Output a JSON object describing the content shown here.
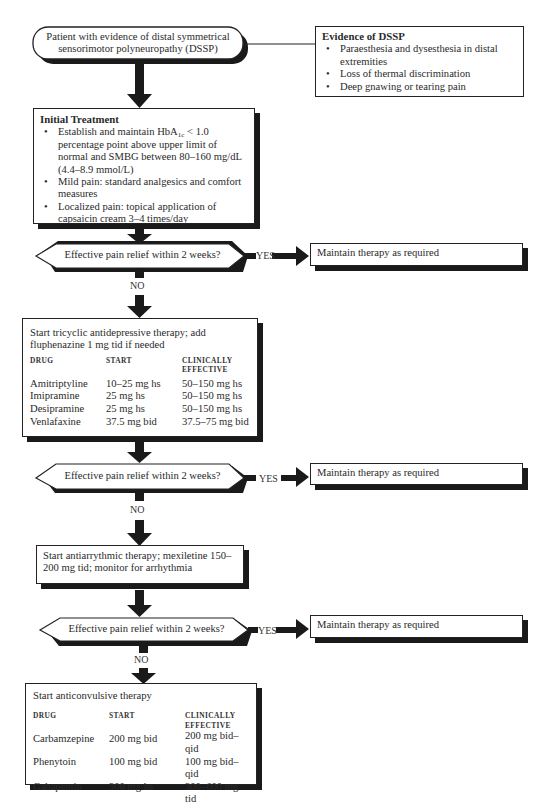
{
  "start_node": {
    "text_line1": "Patient with evidence of distal symmetrical",
    "text_line2": "sensorimotor polyneuropathy (DSSP)"
  },
  "evidence_box": {
    "title": "Evidence of DSSP",
    "items": [
      "Paraesthesia and dysesthesia in distal extremities",
      "Loss of thermal discrimination",
      "Deep gnawing or tearing pain"
    ]
  },
  "initial_treatment": {
    "title": "Initial Treatment",
    "item1_pre": "Establish and maintain HbA",
    "item1_sub": "1c",
    "item1_post": " < 1.0 percentage point above upper limit of normal and SMBG between 80–160 mg/dL (4.4–8.9 mmol/L)",
    "item2": "Mild pain: standard analgesics and comfort measures",
    "item3": "Localized pain: topical application of capsaicin cream 3–4 times/day"
  },
  "decisions": [
    {
      "question": "Effective pain relief within 2 weeks?",
      "yes_label": "YES",
      "no_label": "NO",
      "yes_outcome": "Maintain therapy as required"
    },
    {
      "question": "Effective pain relief within 2 weeks?",
      "yes_label": "YES",
      "no_label": "NO",
      "yes_outcome": "Maintain therapy as required"
    },
    {
      "question": "Effective pain relief within 2 weeks?",
      "yes_label": "YES",
      "no_label": "NO",
      "yes_outcome": "Maintain therapy as required"
    }
  ],
  "tricyclic_box": {
    "intro": "Start tricyclic antidepressive therapy; add fluphenazine 1 mg tid if needed",
    "headers": [
      "DRUG",
      "START",
      "CLINICALLY",
      "EFFECTIVE"
    ],
    "rows": [
      {
        "drug": "Amitriptyline",
        "start": "10–25 mg hs",
        "effective": "50–150 mg hs"
      },
      {
        "drug": "Imipramine",
        "start": "25 mg hs",
        "effective": "50–150 mg hs"
      },
      {
        "drug": "Desipramine",
        "start": "25 mg hs",
        "effective": "50–150 mg hs"
      },
      {
        "drug": "Venlafaxine",
        "start": "37.5 mg bid",
        "effective": "37.5–75 mg bid"
      }
    ]
  },
  "antiarrhythmic_box": {
    "text": "Start antiarrythmic therapy; mexiletine 150–200 mg tid; monitor for arrhythmia"
  },
  "anticonvulsive_box": {
    "intro": "Start anticonvulsive therapy",
    "headers": [
      "DRUG",
      "START",
      "CLINICALLY",
      "EFFECTIVE"
    ],
    "rows": [
      {
        "drug": "Carbamzepine",
        "start": "200 mg bid",
        "effective": "200 mg bid–qid"
      },
      {
        "drug": "Phenytoin",
        "start": "100 mg bid",
        "effective": "100 mg bid–qid"
      },
      {
        "drug": "Gabapentin",
        "start": "300 mg hs",
        "effective": "300–600 mg tid"
      }
    ]
  },
  "colors": {
    "ink": "#1a1a1a",
    "background": "#ffffff"
  }
}
